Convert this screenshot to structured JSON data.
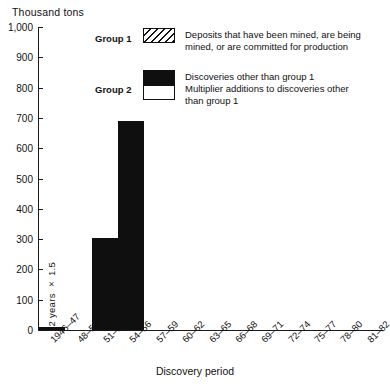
{
  "chart_data": {
    "type": "bar",
    "title": "",
    "unit_label": "Thousand tons",
    "xlabel": "Discovery period",
    "ylabel": "Thousand tons",
    "ylim": [
      0,
      1000
    ],
    "ytick_step": 100,
    "grid": false,
    "categories": [
      "1946–47",
      "48–50",
      "51–53",
      "54–56",
      "57–59",
      "60–62",
      "63–65",
      "66–68",
      "69–71",
      "72–74",
      "75–77",
      "78–80",
      "81–82"
    ],
    "values": [
      10,
      0,
      305,
      690,
      0,
      0,
      0,
      0,
      0,
      0,
      0,
      0,
      0
    ],
    "ytick_labels": [
      "0",
      "100",
      "200",
      "300",
      "400",
      "500",
      "600",
      "700",
      "800",
      "900",
      "1,000"
    ],
    "ytick_values": [
      0,
      100,
      200,
      300,
      400,
      500,
      600,
      700,
      800,
      900,
      1000
    ],
    "series": [
      {
        "name": "Group 2",
        "values": [
          10,
          0,
          305,
          690,
          0,
          0,
          0,
          0,
          0,
          0,
          0,
          0,
          0
        ]
      }
    ],
    "annotations": [
      {
        "text": "2 years × 1.5",
        "orientation": "vertical",
        "position": "inside-plot-left"
      }
    ],
    "legend_position": "upper-center",
    "bar_color": "#100f0f"
  },
  "axes": {
    "y_unit": "Thousand tons",
    "x_title": "Discovery period",
    "y_ticks": [
      "1,000",
      "900",
      "800",
      "700",
      "600",
      "500",
      "400",
      "300",
      "200",
      "100",
      "0"
    ],
    "x_ticks": [
      "1946–47",
      "48–50",
      "51–53",
      "54–56",
      "57–59",
      "60–62",
      "63–65",
      "66–68",
      "69–71",
      "72–74",
      "75–77",
      "78–80",
      "81–82"
    ]
  },
  "annotation": {
    "vertical_note": "2 years × 1.5"
  },
  "legend": {
    "entries": [
      {
        "name": "Group 1",
        "swatch": "hatched",
        "lines": [
          "Deposits that have been mined, are being",
          "mined, or are committed for production"
        ]
      },
      {
        "name": "Group 2",
        "swatch": "solid-and-white",
        "lines": [
          "Discoveries other than group 1",
          "Multiplier additions to discoveries other",
          "than group 1"
        ]
      }
    ]
  }
}
